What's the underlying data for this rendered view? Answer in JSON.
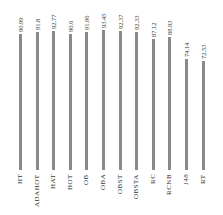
{
  "chart_data": {
    "type": "bar",
    "title": "",
    "xlabel": "",
    "ylabel": "",
    "categories": [
      "HT",
      "ADAHOT",
      "HAT",
      "HOT",
      "OB",
      "OBA",
      "OBST",
      "OBSTA",
      "RC",
      "RCNB",
      "J48",
      "RT"
    ],
    "values": [
      90.99,
      91.8,
      92.77,
      90.6,
      91.96,
      93.45,
      92.37,
      92.33,
      87.12,
      88.93,
      74.14,
      72.53
    ],
    "value_labels": [
      "90.99",
      "91.8",
      "92.77",
      "90.6",
      "91.96",
      "93.45",
      "92.37",
      "92.33",
      "87.12",
      "88.93",
      "74.14",
      "72.53"
    ],
    "ylim": [
      0,
      100
    ],
    "grid": false,
    "legend": null,
    "orientation": "vertical",
    "bar_color": "#8a8a8a"
  }
}
